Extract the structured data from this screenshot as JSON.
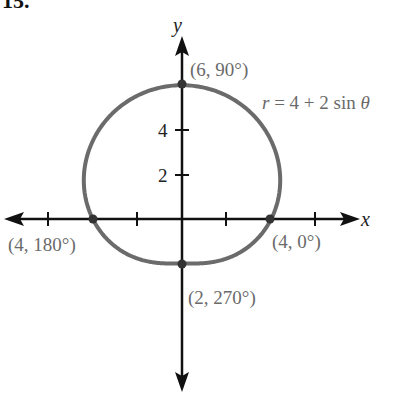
{
  "problem_number": "15.",
  "chart_data": {
    "type": "line",
    "subtype": "polar",
    "title": "",
    "equation": "r = 4 + 2 sin θ",
    "xlabel": "x",
    "ylabel": "y",
    "x_ticks": [
      -6,
      -4,
      -2,
      2,
      4,
      6
    ],
    "y_tick_labels": [
      "2",
      "4"
    ],
    "xlim": [
      -8,
      8
    ],
    "ylim": [
      -8,
      8
    ],
    "grid": false,
    "labeled_points": [
      {
        "label": "(6, 90°)",
        "r": 6,
        "theta_deg": 90,
        "x": 0,
        "y": 6
      },
      {
        "label": "(4, 0°)",
        "r": 4,
        "theta_deg": 0,
        "x": 4,
        "y": 0
      },
      {
        "label": "(4, 180°)",
        "r": 4,
        "theta_deg": 180,
        "x": -4,
        "y": 0
      },
      {
        "label": "(2, 270°)",
        "r": 2,
        "theta_deg": 270,
        "x": 0,
        "y": -2
      }
    ],
    "series": [
      {
        "name": "r = 4 + 2 sin θ",
        "r_formula": "4 + 2*sin(theta)",
        "theta_range_deg": [
          0,
          360
        ],
        "color": "#6b6b6b"
      }
    ]
  },
  "labels": {
    "equation_r": "r",
    "equation_rest": " = 4 + 2 sin ",
    "equation_theta": "θ",
    "x_axis": "x",
    "y_axis": "y",
    "tick_2": "2",
    "tick_4": "4",
    "p90": "(6, 90°)",
    "p0": "(4, 0°)",
    "p180": "(4, 180°)",
    "p270": "(2, 270°)"
  }
}
